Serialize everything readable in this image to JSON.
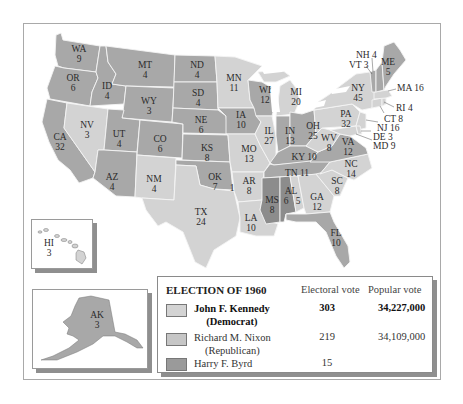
{
  "colors": {
    "democrat": "#d3d3d3",
    "republican": "#a8a8a8",
    "byrd": "#8c8c8c",
    "border": "#f2f2f2",
    "water": "#ffffff"
  },
  "legend": {
    "title": "ELECTION OF 1960",
    "col_electoral": "Electoral vote",
    "col_popular": "Popular vote",
    "candidates": [
      {
        "name": "John F. Kennedy",
        "party": "(Democrat)",
        "electoral": "303",
        "popular": "34,227,000",
        "bold": true
      },
      {
        "name": "Richard M. Nixon",
        "party": "(Republican)",
        "electoral": "219",
        "popular": "34,109,000",
        "bold": false
      },
      {
        "name": "Harry F. Byrd",
        "party": "",
        "electoral": "15",
        "popular": "",
        "bold": false
      }
    ]
  },
  "states": {
    "WA": {
      "abbr": "WA",
      "ev": "9",
      "winner": "republican"
    },
    "OR": {
      "abbr": "OR",
      "ev": "6",
      "winner": "republican"
    },
    "CA": {
      "abbr": "CA",
      "ev": "32",
      "winner": "republican"
    },
    "ID": {
      "abbr": "ID",
      "ev": "4",
      "winner": "republican"
    },
    "NV": {
      "abbr": "NV",
      "ev": "3",
      "winner": "democrat"
    },
    "MT": {
      "abbr": "MT",
      "ev": "4",
      "winner": "republican"
    },
    "WY": {
      "abbr": "WY",
      "ev": "3",
      "winner": "republican"
    },
    "UT": {
      "abbr": "UT",
      "ev": "4",
      "winner": "republican"
    },
    "AZ": {
      "abbr": "AZ",
      "ev": "4",
      "winner": "republican"
    },
    "CO": {
      "abbr": "CO",
      "ev": "6",
      "winner": "republican"
    },
    "NM": {
      "abbr": "NM",
      "ev": "4",
      "winner": "democrat"
    },
    "ND": {
      "abbr": "ND",
      "ev": "4",
      "winner": "republican"
    },
    "SD": {
      "abbr": "SD",
      "ev": "4",
      "winner": "republican"
    },
    "NE": {
      "abbr": "NE",
      "ev": "6",
      "winner": "republican"
    },
    "KS": {
      "abbr": "KS",
      "ev": "8",
      "winner": "republican"
    },
    "OK": {
      "abbr": "OK",
      "ev": "7",
      "ev_byrd": "1",
      "winner": "republican"
    },
    "TX": {
      "abbr": "TX",
      "ev": "24",
      "winner": "democrat"
    },
    "MN": {
      "abbr": "MN",
      "ev": "11",
      "winner": "democrat"
    },
    "IA": {
      "abbr": "IA",
      "ev": "10",
      "winner": "republican"
    },
    "MO": {
      "abbr": "MO",
      "ev": "13",
      "winner": "democrat"
    },
    "AR": {
      "abbr": "AR",
      "ev": "8",
      "winner": "democrat"
    },
    "LA": {
      "abbr": "LA",
      "ev": "10",
      "winner": "democrat"
    },
    "WI": {
      "abbr": "WI",
      "ev": "12",
      "winner": "republican"
    },
    "IL": {
      "abbr": "IL",
      "ev": "27",
      "winner": "democrat"
    },
    "MI": {
      "abbr": "MI",
      "ev": "20",
      "winner": "democrat"
    },
    "IN": {
      "abbr": "IN",
      "ev": "13",
      "winner": "republican"
    },
    "OH": {
      "abbr": "OH",
      "ev": "25",
      "winner": "republican"
    },
    "KY": {
      "abbr": "KY",
      "ev": "10",
      "winner": "republican"
    },
    "TN": {
      "abbr": "TN",
      "ev": "11",
      "winner": "republican"
    },
    "MS": {
      "abbr": "MS",
      "ev": "8",
      "winner": "byrd"
    },
    "AL": {
      "abbr": "AL",
      "ev": "6",
      "ev_dem": "5",
      "winner": "byrd"
    },
    "GA": {
      "abbr": "GA",
      "ev": "12",
      "winner": "democrat"
    },
    "FL": {
      "abbr": "FL",
      "ev": "10",
      "winner": "republican"
    },
    "SC": {
      "abbr": "SC",
      "ev": "8",
      "winner": "democrat"
    },
    "NC": {
      "abbr": "NC",
      "ev": "14",
      "winner": "democrat"
    },
    "VA": {
      "abbr": "VA",
      "ev": "12",
      "winner": "republican"
    },
    "WV": {
      "abbr": "WV",
      "ev": "8",
      "winner": "democrat"
    },
    "PA": {
      "abbr": "PA",
      "ev": "32",
      "winner": "democrat"
    },
    "NY": {
      "abbr": "NY",
      "ev": "45",
      "winner": "democrat"
    },
    "ME": {
      "abbr": "ME",
      "ev": "5",
      "winner": "republican"
    },
    "HI": {
      "abbr": "HI",
      "ev": "3",
      "winner": "democrat"
    },
    "AK": {
      "abbr": "AK",
      "ev": "3",
      "winner": "republican"
    }
  },
  "callouts": {
    "NH": "NH 4",
    "VT": "VT 3",
    "MA": "MA 16",
    "RI": "RI 4",
    "CT": "CT 8",
    "NJ": "NJ 16",
    "DE": "DE 3",
    "MD": "MD 9"
  }
}
